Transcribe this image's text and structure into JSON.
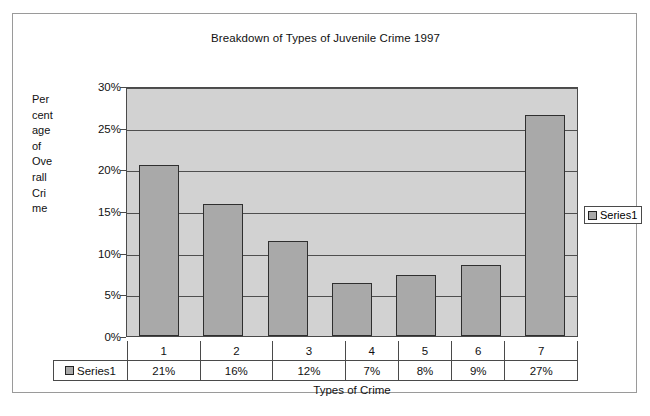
{
  "chart_data": {
    "type": "bar",
    "title": "Breakdown of Types of Juvenile Crime 1997",
    "xlabel": "Types of Crime",
    "ylabel": "Percentage of Overall Crime",
    "categories": [
      "1",
      "2",
      "3",
      "4",
      "5",
      "6",
      "7"
    ],
    "values": [
      20.5,
      15.8,
      11.4,
      6.4,
      7.3,
      8.5,
      26.5
    ],
    "data_labels": [
      "21%",
      "16%",
      "12%",
      "7%",
      "8%",
      "9%",
      "27%"
    ],
    "series": [
      {
        "name": "Series1",
        "values": [
          20.5,
          15.8,
          11.4,
          6.4,
          7.3,
          8.5,
          26.5
        ]
      }
    ],
    "ylim": [
      0,
      30
    ],
    "ytick_labels": [
      "0%",
      "5%",
      "10%",
      "15%",
      "20%",
      "25%",
      "30%"
    ],
    "ytick_values": [
      0,
      5,
      10,
      15,
      20,
      25,
      30
    ],
    "grid": true,
    "legend": [
      "Series1"
    ],
    "legend_position": "right",
    "colors": {
      "bar_fill": "#a9a9a9",
      "bar_outline": "#2f2f2f",
      "plot_background": "#d2d2d2",
      "gridline": "#4f4f4f"
    }
  },
  "y_axis_caption_lines": [
    "Per",
    "cent",
    "age",
    "of",
    "Ove",
    "rall",
    "Cri",
    "me"
  ],
  "legend": {
    "series_label": "Series1"
  },
  "table": {
    "series_label": "Series1",
    "categories": [
      "1",
      "2",
      "3",
      "4",
      "5",
      "6",
      "7"
    ],
    "values": [
      "21%",
      "16%",
      "12%",
      "7%",
      "8%",
      "9%",
      "27%"
    ]
  }
}
